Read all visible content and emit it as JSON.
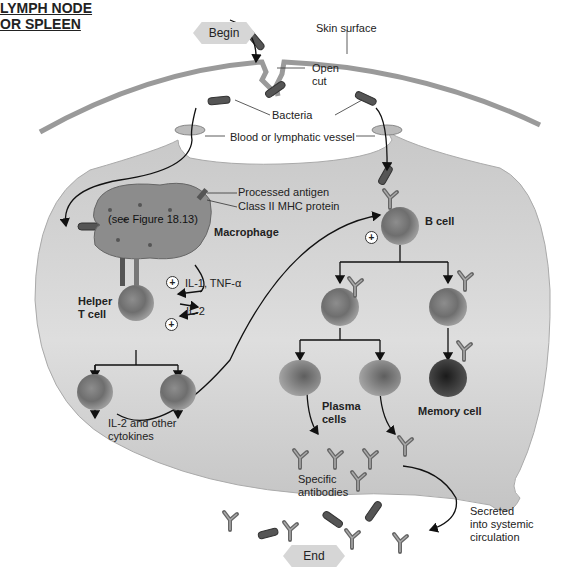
{
  "flow": {
    "begin": "Begin",
    "end": "End"
  },
  "labels": {
    "skin_surface": "Skin surface",
    "open_cut_1": "Open",
    "open_cut_2": "cut",
    "bacteria": "Bacteria",
    "vessel": "Blood or lymphatic vessel",
    "organ_title_1": "LYMPH NODE",
    "organ_title_2": "OR SPLEEN",
    "processed_antigen": "Processed antigen",
    "class_ii_mhc": "Class II MHC protein",
    "see_figure": "(see Figure 18.13)",
    "macrophage": "Macrophage",
    "il1_tnf": "IL-1, TNF-α",
    "il2": "IL-2",
    "helper_t_1": "Helper",
    "helper_t_2": "T cell",
    "b_cell": "B cell",
    "il2_other_1": "IL-2 and other",
    "il2_other_2": "cytokines",
    "plasma_1": "Plasma",
    "plasma_2": "cells",
    "memory_cell": "Memory cell",
    "specific_1": "Specific",
    "specific_2": "antibodies",
    "secreted_1": "Secreted",
    "secreted_2": "into systemic",
    "secreted_3": "circulation"
  },
  "symbols": {
    "stimulate": "+"
  },
  "colors": {
    "organ_fill": "#cfcfcf",
    "skin": "#9a9a9a",
    "cell": "#7a7a7a",
    "memory_cell": "#333333",
    "bacteria": "#555555",
    "line": "#111111"
  }
}
